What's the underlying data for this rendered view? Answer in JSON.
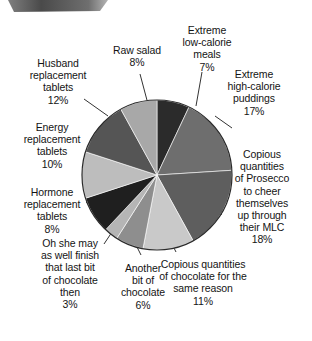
{
  "chart_data": {
    "type": "pie",
    "title": "",
    "subtitle": "",
    "xlabel": "",
    "ylabel": "",
    "legend_position": "none",
    "grid": false,
    "labels_placement": "outside-with-leader-lines",
    "start_angle_deg": 0,
    "direction": "clockwise",
    "categories": [
      "Extreme low-calorie meals",
      "Extreme high-calorie puddings",
      "Copious quantities of Prosecco to cheer themselves up through their MLC",
      "Copious quantities of chocolate for the same reason",
      "Another bit of chocolate",
      "Oh she may as well finish that last bit of chocolate then",
      "Hormone replacement tablets",
      "Energy replacement tablets",
      "Husband replacement tablets",
      "Raw salad"
    ],
    "values": [
      7,
      17,
      18,
      11,
      6,
      3,
      8,
      10,
      12,
      8
    ],
    "value_unit": "%",
    "total": 100,
    "colors": [
      "#2b2b2b",
      "#6e6e6e",
      "#5e5e5e",
      "#c9c9c9",
      "#8e8e8e",
      "#b5b5b5",
      "#1f1f1f",
      "#bdbdbd",
      "#555555",
      "#a8a8a8"
    ],
    "slices": [
      {
        "name": "extreme-low-calorie-meals",
        "label": "Extreme\nlow-calorie\nmeals\n7%",
        "label_text": "Extreme low-calorie meals",
        "value": 7,
        "percent_text": "7%",
        "color": "#2b2b2b"
      },
      {
        "name": "extreme-high-calorie-puddings",
        "label": "Extreme\nhigh-calorie\npuddings\n17%",
        "label_text": "Extreme high-calorie puddings",
        "value": 17,
        "percent_text": "17%",
        "color": "#6e6e6e"
      },
      {
        "name": "copious-prosecco",
        "label": "Copious\nquantities\nof Prosecco\nto cheer\nthemselves\nup through\ntheir MLC\n18%",
        "label_text": "Copious quantities of Prosecco to cheer themselves up through their MLC",
        "value": 18,
        "percent_text": "18%",
        "color": "#5e5e5e"
      },
      {
        "name": "copious-chocolate-same-reason",
        "label": "Copious quantities\nof chocolate for the\nsame reason\n11%",
        "label_text": "Copious quantities of chocolate for the same reason",
        "value": 11,
        "percent_text": "11%",
        "color": "#c9c9c9"
      },
      {
        "name": "another-bit-of-chocolate",
        "label": "Another\nbit of\nchocolate\n6%",
        "label_text": "Another bit of chocolate",
        "value": 6,
        "percent_text": "6%",
        "color": "#8e8e8e"
      },
      {
        "name": "oh-she-may-as-well",
        "label": "Oh she may\nas well finish\nthat last bit\nof chocolate\nthen\n3%",
        "label_text": "Oh she may as well finish that last bit of chocolate then",
        "value": 3,
        "percent_text": "3%",
        "color": "#b5b5b5"
      },
      {
        "name": "hormone-replacement-tablets",
        "label": "Hormone\nreplacement\ntablets\n8%",
        "label_text": "Hormone replacement tablets",
        "value": 8,
        "percent_text": "8%",
        "color": "#1f1f1f"
      },
      {
        "name": "energy-replacement-tablets",
        "label": "Energy\nreplacement\ntablets\n10%",
        "label_text": "Energy replacement tablets",
        "value": 10,
        "percent_text": "10%",
        "color": "#bdbdbd"
      },
      {
        "name": "husband-replacement-tablets",
        "label": "Husband\nreplacement\ntablets\n12%",
        "label_text": "Husband replacement tablets",
        "value": 12,
        "percent_text": "12%",
        "color": "#555555"
      },
      {
        "name": "raw-salad",
        "label": "Raw salad\n8%",
        "label_text": "Raw salad",
        "value": 8,
        "percent_text": "8%",
        "color": "#a8a8a8"
      }
    ]
  }
}
